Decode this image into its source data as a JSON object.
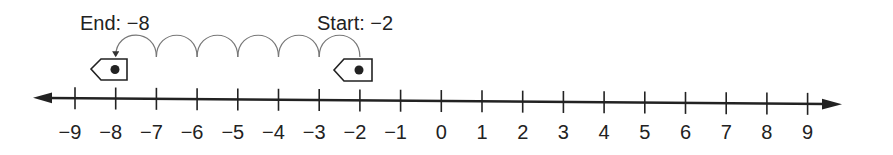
{
  "diagram": {
    "type": "number-line",
    "range": {
      "min": -9,
      "max": 9
    },
    "ticks": [
      "−9",
      "−8",
      "−7",
      "−6",
      "−5",
      "−4",
      "−3",
      "−2",
      "−1",
      "0",
      "1",
      "2",
      "3",
      "4",
      "5",
      "6",
      "7",
      "8",
      "9"
    ],
    "start": {
      "label": "Start: −2",
      "value": -2
    },
    "end": {
      "label": "End: −8",
      "value": -8
    },
    "jumps": {
      "count": 6,
      "direction": "left"
    },
    "colors": {
      "ink": "#222222",
      "arc": "#777777",
      "background": "#ffffff"
    }
  }
}
